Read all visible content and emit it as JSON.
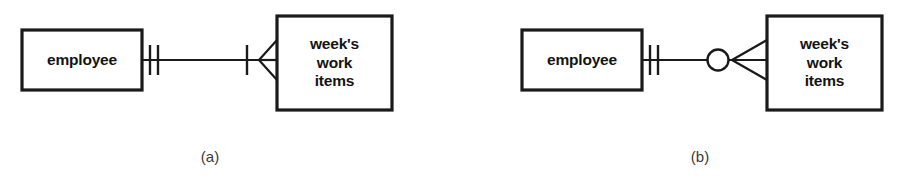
{
  "figure": {
    "background_color": "#ffffff",
    "line_color": "#1a1a1a",
    "text_color": "#141414",
    "caption_color": "#3a3a3a",
    "notation": "crow's foot ER notation",
    "diagrams": [
      {
        "id": "a",
        "caption": "(a)",
        "entities": [
          {
            "name": "employee",
            "label": "employee"
          },
          {
            "name": "weeks-work-items",
            "label": "week's\nwork\nitems"
          }
        ],
        "relationship": {
          "left_symbol": "one-and-only-one",
          "left_glyph": "double-tick",
          "right_symbol": "one-or-many",
          "right_glyph": "tick-and-crows-foot",
          "left_cardinality": "1",
          "right_cardinality": "1..N"
        }
      },
      {
        "id": "b",
        "caption": "(b)",
        "entities": [
          {
            "name": "employee",
            "label": "employee"
          },
          {
            "name": "weeks-work-items",
            "label": "week's\nwork\nitems"
          }
        ],
        "relationship": {
          "left_symbol": "one-and-only-one",
          "left_glyph": "double-tick",
          "right_symbol": "zero-or-many",
          "right_glyph": "circle-and-crows-foot",
          "left_cardinality": "1",
          "right_cardinality": "0..N"
        }
      }
    ]
  }
}
